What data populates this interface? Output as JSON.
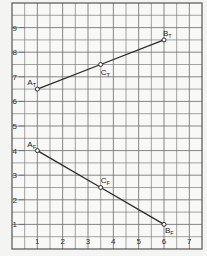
{
  "chart_data": {
    "type": "line",
    "title": "",
    "xlabel": "",
    "ylabel": "",
    "xlim": [
      0,
      7.5
    ],
    "ylim": [
      0,
      10
    ],
    "grid": true,
    "grid_step": 0.5,
    "x_ticks": [
      "1",
      "2",
      "3",
      "4",
      "5",
      "6",
      "7"
    ],
    "y_ticks": [
      "1",
      "2",
      "3",
      "4",
      "5",
      "6",
      "7",
      "8",
      "9"
    ],
    "series": [
      {
        "name": "T",
        "points": [
          {
            "label": "A",
            "sub": "T",
            "x": 1,
            "y": 6.5
          },
          {
            "label": "C",
            "sub": "T",
            "x": 3.5,
            "y": 7.5
          },
          {
            "label": "B",
            "sub": "T",
            "x": 6,
            "y": 8.5
          }
        ]
      },
      {
        "name": "F",
        "points": [
          {
            "label": "A",
            "sub": "F",
            "x": 1,
            "y": 4
          },
          {
            "label": "C",
            "sub": "F",
            "x": 3.5,
            "y": 2.5
          },
          {
            "label": "B",
            "sub": "F",
            "x": 6,
            "y": 1
          }
        ]
      }
    ],
    "colors": {
      "grid": "#6a6a6a",
      "line": "#2a2a2a",
      "background": "#f8f8f6"
    }
  }
}
